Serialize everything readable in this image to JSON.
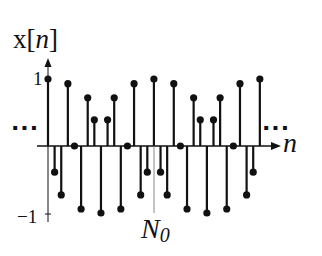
{
  "chart_data": {
    "type": "stem",
    "title": "",
    "ylabel": "x[n]",
    "ylabel_parts": {
      "base": "x[",
      "var": "n",
      "close": "]"
    },
    "xlabel": "n",
    "marker_label": "N0",
    "marker_label_parts": {
      "base": "N",
      "sub": "0"
    },
    "y_ticks": [
      "1",
      "−1"
    ],
    "continuation_left": "···",
    "continuation_right": "···",
    "ylim": [
      -1,
      1
    ],
    "grid": false,
    "period": 16,
    "n_relative_to_N0": [
      -16,
      -15,
      -14,
      -13,
      -12,
      -11,
      -10,
      -9,
      -8,
      -7,
      -6,
      -5,
      -4,
      -3,
      -2,
      -1,
      0,
      1,
      2,
      3,
      4,
      5,
      6,
      7,
      8,
      9,
      10,
      11,
      12,
      13,
      14,
      15,
      16
    ],
    "values": [
      1.0,
      -0.39,
      -0.73,
      0.93,
      0.0,
      -0.94,
      0.72,
      0.39,
      -1.0,
      0.39,
      0.72,
      -0.94,
      0.0,
      0.93,
      -0.73,
      -0.39,
      1.0,
      -0.39,
      -0.73,
      0.93,
      0.0,
      -0.94,
      0.72,
      0.39,
      -1.0,
      0.39,
      0.72,
      -0.94,
      0.0,
      0.93,
      -0.73,
      -0.39,
      1.0
    ],
    "layout": {
      "origin_x": 48,
      "axis_y": 146,
      "unit_px": 67,
      "step_px": 6.62,
      "axis_x_start": 37,
      "axis_x_end": 281,
      "yaxis_top": 58,
      "yaxis_bottom": 222,
      "n0_x": 154,
      "n0_line_bottom": 213
    },
    "colors": {
      "ink": "#111111",
      "guide": "#888888"
    }
  }
}
